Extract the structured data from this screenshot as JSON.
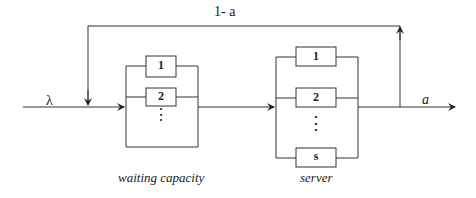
{
  "diagram": {
    "input_label": "λ",
    "feedback_label": "1- a",
    "output_label": "a",
    "waiting": {
      "caption": "waiting capacity",
      "slots": [
        "1",
        "2"
      ],
      "ellipsis": "⋮"
    },
    "server": {
      "caption": "server",
      "slots": [
        "1",
        "2",
        "s"
      ],
      "ellipsis": "⋮"
    }
  }
}
